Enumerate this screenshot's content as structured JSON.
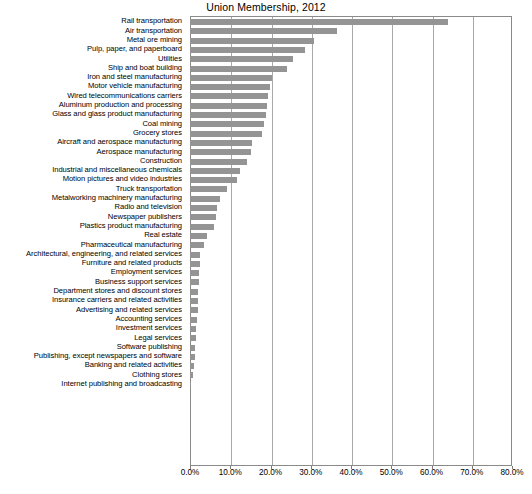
{
  "chart_data": {
    "type": "bar",
    "orientation": "horizontal",
    "title": "Union Membership, 2012",
    "xlabel": "",
    "ylabel": "",
    "xlim": [
      0,
      80
    ],
    "xunit": "%",
    "grid": true,
    "legend": "none",
    "bar_color": "#949494",
    "xticks": [
      "0.0%",
      "10.0%",
      "20.0%",
      "30.0%",
      "40.0%",
      "50.0%",
      "60.0%",
      "70.0%",
      "80.0%"
    ],
    "xtick_values": [
      0,
      10,
      20,
      30,
      40,
      50,
      60,
      70,
      80
    ],
    "categories": [
      "Rail transportation",
      "Air transportation",
      "Metal ore mining",
      "Pulp, paper, and paperboard",
      "Utilities",
      "Ship and boat building",
      "Iron and steel manufacturing",
      "Motor vehicle manufacturing",
      "Wired telecommunications carriers",
      "Aluminum production and processing",
      "Glass and glass product manufacturing",
      "Coal mining",
      "Grocery stores",
      "Aircraft and aerospace manufacturing",
      "Aerospace manufacturing",
      "Construction",
      "Industrial and miscellaneous chemicals",
      "Motion pictures and video industries",
      "Truck transportation",
      "Metalworking machinery manufacturing",
      "Radio and television",
      "Newspaper publishers",
      "Plastics product manufacturing",
      "Real estate",
      "Pharmaceutical manufacturing",
      "Architectural, engineering, and related services",
      "Furniture and related products",
      "Employment services",
      "Business support services",
      "Department stores and discount stores",
      "Insurance carriers and related activities",
      "Advertising and related services",
      "Accounting services",
      "Investment services",
      "Legal services",
      "Software publishing",
      "Publishing, except newspapers and software",
      "Banking and related activities",
      "Clothing stores",
      "Internet publishing and broadcasting"
    ],
    "values": [
      64.0,
      36.5,
      30.8,
      28.5,
      25.5,
      24.0,
      20.3,
      19.8,
      19.3,
      19.2,
      19.0,
      18.5,
      17.9,
      15.3,
      15.1,
      14.2,
      12.3,
      11.6,
      9.2,
      7.5,
      6.8,
      6.5,
      6.0,
      4.1,
      3.6,
      2.6,
      2.6,
      2.3,
      2.2,
      2.1,
      2.0,
      1.9,
      1.7,
      1.5,
      1.4,
      1.3,
      1.2,
      1.1,
      0.8,
      0.3
    ]
  }
}
